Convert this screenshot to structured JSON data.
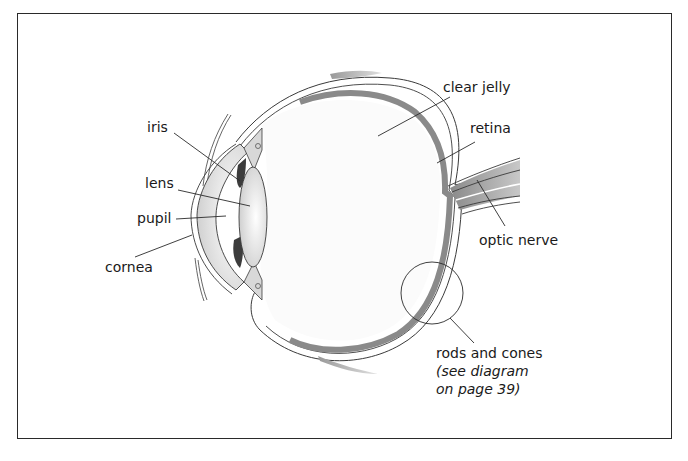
{
  "diagram": {
    "type": "anatomical-cross-section",
    "labels": {
      "iris": "iris",
      "lens": "lens",
      "pupil": "pupil",
      "cornea": "cornea",
      "clear_jelly": "clear jelly",
      "retina": "retina",
      "optic_nerve": "optic nerve",
      "rods_and_cones": "rods and cones",
      "note_line1": "(see diagram",
      "note_line2": "on page 39)"
    },
    "colors": {
      "border": "#2a2a2a",
      "outline": "#3a3a3a",
      "retina_band": "#8a8a8a",
      "sclera_fill": "#f2f2f2",
      "shading": "#b8b8b8",
      "dark": "#3c3c3c"
    }
  }
}
